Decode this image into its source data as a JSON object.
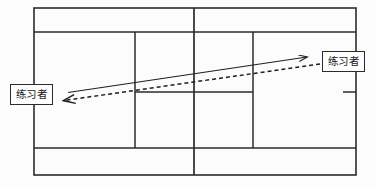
{
  "diagram": {
    "type": "sports-court-drill-diagram",
    "sport": "tennis-court",
    "background_color": "#fcfcfc",
    "line_color": "#2b2b2b",
    "labels": [
      {
        "id": "player-left",
        "text": "练习者",
        "position": "left-baseline-outside"
      },
      {
        "id": "player-right",
        "text": "练习者",
        "position": "right-side-upper-outside"
      }
    ],
    "arrows": [
      {
        "id": "solid-arrow-right",
        "style": "solid",
        "direction": "left-to-right",
        "from": [
          68,
          92
        ],
        "to": [
          308,
          57
        ],
        "meaning": "ball-path-outgoing"
      },
      {
        "id": "dashed-arrow-left",
        "style": "dashed",
        "direction": "right-to-left",
        "from": [
          320,
          64
        ],
        "to": [
          62,
          101
        ],
        "meaning": "ball-path-returning"
      }
    ],
    "court_geometry": {
      "outer": {
        "x1": 34,
        "y1": 8,
        "x2": 356,
        "y2": 175
      },
      "horizontal_lines_y": [
        8,
        32,
        148,
        175
      ],
      "vertical_lines_x": [
        34,
        135,
        194,
        253,
        356
      ],
      "service_line": {
        "x1": 135,
        "y1": 92,
        "x2": 253,
        "y2": 92
      },
      "side_tick": {
        "x1": 343,
        "y1": 92,
        "x2": 356,
        "y2": 92
      }
    }
  }
}
